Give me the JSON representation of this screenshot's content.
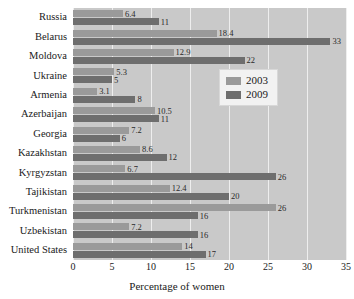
{
  "chart_data": {
    "type": "bar",
    "orientation": "horizontal",
    "title": "",
    "xlabel": "Percentage of women",
    "ylabel": "",
    "xlim": [
      0,
      35
    ],
    "xticks": [
      0,
      5,
      10,
      15,
      20,
      25,
      30,
      35
    ],
    "grid": true,
    "legend_position": "right",
    "categories": [
      "Russia",
      "Belarus",
      "Moldova",
      "Ukraine",
      "Armenia",
      "Azerbaijan",
      "Georgia",
      "Kazakhstan",
      "Kyrgyzstan",
      "Tajikistan",
      "Turkmenistan",
      "Uzbekistan",
      "United States"
    ],
    "series": [
      {
        "name": "2003",
        "color": "#9a9a9a",
        "values": [
          6.4,
          18.4,
          12.9,
          5.3,
          3.1,
          10.5,
          7.2,
          8.6,
          6.7,
          12.4,
          26,
          7.2,
          14
        ]
      },
      {
        "name": "2009",
        "color": "#6e6e6e",
        "values": [
          11,
          33,
          22,
          5,
          8,
          11,
          6,
          12,
          26,
          20,
          16,
          16,
          17
        ]
      }
    ],
    "value_labels": {
      "2003": [
        "6.4",
        "18.4",
        "12.9",
        "5.3",
        "3.1",
        "10.5",
        "7.2",
        "8.6",
        "6.7",
        "12.4",
        "26",
        "7.2",
        "14"
      ],
      "2009": [
        "11",
        "33",
        "22",
        "5",
        "8",
        "11",
        "6",
        "12",
        "26",
        "20",
        "16",
        "16",
        "17"
      ]
    }
  },
  "legend": {
    "items": [
      {
        "label": "2003",
        "key": "s2003"
      },
      {
        "label": "2009",
        "key": "s2009"
      }
    ]
  },
  "colors": {
    "plot_background": "#c9c9c9",
    "gridline": "#eeeeee",
    "series_2003": "#9a9a9a",
    "series_2009": "#6e6e6e",
    "text": "#1a1a1a"
  }
}
